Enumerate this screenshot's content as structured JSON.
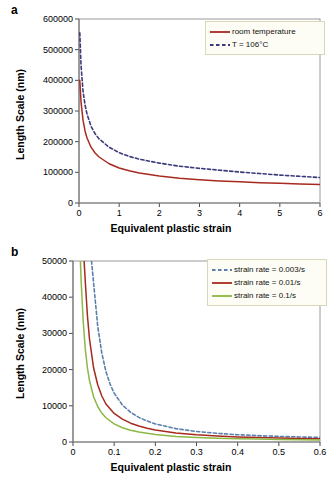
{
  "figure": {
    "panels": [
      {
        "label": "a",
        "xlabel": "Equivalent plastic strain",
        "ylabel": "Length Scale (nm)",
        "xticks": [
          "0",
          "1",
          "2",
          "3",
          "4",
          "5",
          "6"
        ],
        "yticks": [
          "0",
          "100000",
          "200000",
          "300000",
          "400000",
          "500000",
          "600000"
        ],
        "legend": [
          {
            "label": "room temperature",
            "style": "solid",
            "color": "#a62a1f"
          },
          {
            "label": "T = 106°C",
            "style": "dashed",
            "color": "#3b3a7a"
          }
        ]
      },
      {
        "label": "b",
        "xlabel": "Equivalent plastic strain",
        "ylabel": "Length Scale (nm)",
        "xticks": [
          "0",
          "0.1",
          "0.2",
          "0.3",
          "0.4",
          "0.5",
          "0.6"
        ],
        "yticks": [
          "0",
          "10000",
          "20000",
          "30000",
          "40000",
          "50000"
        ],
        "legend": [
          {
            "label": "strain rate = 0.003/s",
            "style": "dashed",
            "color": "#5a7fae"
          },
          {
            "label": "strain rate = 0.01/s",
            "style": "solid",
            "color": "#a62a1f"
          },
          {
            "label": "strain rate = 0.1/s",
            "style": "solid",
            "color": "#8cb845"
          }
        ]
      }
    ]
  },
  "chart_data": [
    {
      "type": "line",
      "title": "a",
      "xlabel": "Equivalent plastic strain",
      "ylabel": "Length Scale (nm)",
      "xlim": [
        0,
        6
      ],
      "ylim": [
        0,
        600000
      ],
      "xticks": [
        0,
        1,
        2,
        3,
        4,
        5,
        6
      ],
      "yticks": [
        0,
        100000,
        200000,
        300000,
        400000,
        500000,
        600000
      ],
      "grid": false,
      "legend_position": "top-right",
      "series": [
        {
          "name": "room temperature",
          "style": "solid",
          "color": "#a62a1f",
          "x": [
            0.02,
            0.05,
            0.1,
            0.15,
            0.2,
            0.3,
            0.4,
            0.5,
            0.75,
            1.0,
            1.25,
            1.5,
            2.0,
            2.5,
            3.0,
            3.5,
            4.0,
            4.5,
            5.0,
            5.5,
            6.0
          ],
          "y": [
            400000,
            330000,
            270000,
            235000,
            212000,
            182000,
            163000,
            150000,
            128000,
            114000,
            105000,
            98000,
            88000,
            81000,
            76000,
            72000,
            69000,
            66000,
            64000,
            62000,
            60000
          ]
        },
        {
          "name": "T = 106°C",
          "style": "dashed",
          "color": "#3b3a7a",
          "x": [
            0.02,
            0.05,
            0.1,
            0.15,
            0.2,
            0.3,
            0.4,
            0.5,
            0.75,
            1.0,
            1.25,
            1.5,
            2.0,
            2.5,
            3.0,
            3.5,
            4.0,
            4.5,
            5.0,
            5.5,
            6.0
          ],
          "y": [
            555000,
            450000,
            365000,
            320000,
            290000,
            250000,
            226000,
            209000,
            182000,
            164000,
            152000,
            143000,
            130000,
            120000,
            113000,
            107000,
            101000,
            96000,
            91000,
            87000,
            83000
          ]
        }
      ]
    },
    {
      "type": "line",
      "title": "b",
      "xlabel": "Equivalent plastic strain",
      "ylabel": "Length Scale (nm)",
      "xlim": [
        0,
        0.6
      ],
      "ylim": [
        0,
        50000
      ],
      "xticks": [
        0,
        0.1,
        0.2,
        0.3,
        0.4,
        0.5,
        0.6
      ],
      "yticks": [
        0,
        10000,
        20000,
        30000,
        40000,
        50000
      ],
      "grid": false,
      "legend_position": "top-right",
      "series": [
        {
          "name": "strain rate = 0.003/s",
          "style": "dashed",
          "color": "#5a7fae",
          "x": [
            0.045,
            0.05,
            0.06,
            0.07,
            0.08,
            0.09,
            0.1,
            0.12,
            0.14,
            0.16,
            0.18,
            0.2,
            0.25,
            0.3,
            0.35,
            0.4,
            0.45,
            0.5,
            0.55,
            0.6
          ],
          "y": [
            50000,
            44000,
            32000,
            24500,
            19500,
            16000,
            13500,
            10200,
            8200,
            6800,
            5800,
            5000,
            3700,
            2900,
            2400,
            2000,
            1750,
            1550,
            1400,
            1250
          ]
        },
        {
          "name": "strain rate = 0.01/s",
          "style": "solid",
          "color": "#a62a1f",
          "x": [
            0.027,
            0.03,
            0.035,
            0.04,
            0.05,
            0.06,
            0.07,
            0.08,
            0.1,
            0.12,
            0.14,
            0.16,
            0.18,
            0.2,
            0.25,
            0.3,
            0.35,
            0.4,
            0.45,
            0.5,
            0.55,
            0.6
          ],
          "y": [
            50000,
            44000,
            35000,
            28500,
            20500,
            15800,
            12700,
            10500,
            7900,
            6300,
            5200,
            4400,
            3800,
            3300,
            2500,
            2000,
            1650,
            1400,
            1250,
            1100,
            1000,
            900
          ]
        },
        {
          "name": "strain rate = 0.1/s",
          "style": "solid",
          "color": "#8cb845",
          "x": [
            0.018,
            0.02,
            0.025,
            0.03,
            0.035,
            0.04,
            0.05,
            0.06,
            0.07,
            0.08,
            0.1,
            0.12,
            0.14,
            0.16,
            0.18,
            0.2,
            0.25,
            0.3,
            0.35,
            0.4,
            0.45,
            0.5,
            0.55,
            0.6
          ],
          "y": [
            50000,
            44000,
            33000,
            25500,
            20500,
            17000,
            12500,
            9800,
            8000,
            6700,
            5000,
            3950,
            3250,
            2750,
            2400,
            2100,
            1550,
            1250,
            1050,
            900,
            800,
            700,
            640,
            580
          ]
        }
      ]
    }
  ]
}
